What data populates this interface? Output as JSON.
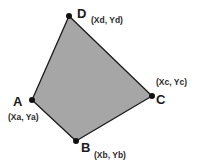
{
  "diagram": {
    "shape": "quadrilateral",
    "fill_color": "#a6a6a6",
    "stroke_color": "#1a1a1a",
    "vertices": [
      {
        "name": "A",
        "coord_label": "(Xa, Ya)",
        "x": 32,
        "y": 100
      },
      {
        "name": "B",
        "coord_label": "(Xb, Yb)",
        "x": 76,
        "y": 141
      },
      {
        "name": "C",
        "coord_label": "(Xc, Yc)",
        "x": 152,
        "y": 96
      },
      {
        "name": "D",
        "coord_label": "(Xd, Yd)",
        "x": 69,
        "y": 16
      }
    ]
  }
}
